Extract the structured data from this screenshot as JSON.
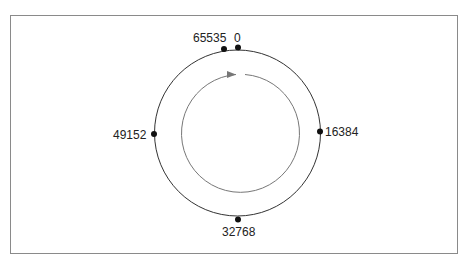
{
  "diagram": {
    "type": "ring",
    "points": [
      {
        "label": "0",
        "position": "top"
      },
      {
        "label": "65535",
        "position": "top-left"
      },
      {
        "label": "16384",
        "position": "right"
      },
      {
        "label": "32768",
        "position": "bottom"
      },
      {
        "label": "49152",
        "position": "left"
      }
    ],
    "direction": "clockwise",
    "colors": {
      "outer_ring": "#333333",
      "inner_arrow": "#777777",
      "dots": "#111111",
      "frame": "#8a8a8a"
    }
  }
}
